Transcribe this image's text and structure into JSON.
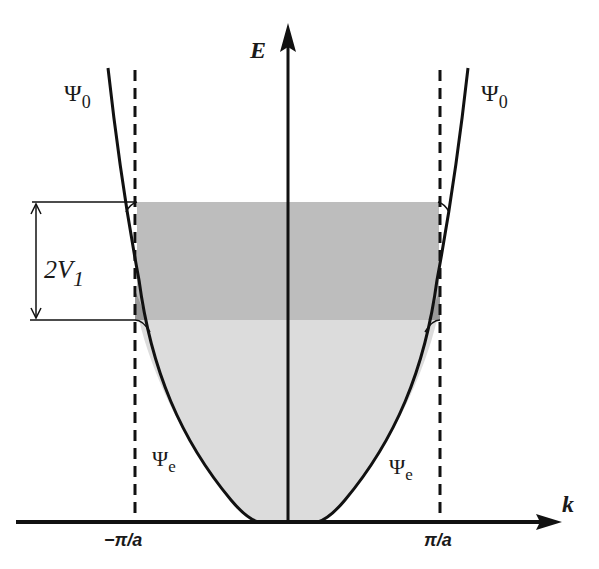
{
  "diagram": {
    "title": "",
    "axes": {
      "y_label": "E",
      "x_label": "k"
    },
    "ticks": {
      "left": "−π/a",
      "right": "π/a"
    },
    "curves": {
      "upper_left": {
        "symbol": "Ψ",
        "subscript": "0"
      },
      "upper_right": {
        "symbol": "Ψ",
        "subscript": "0"
      },
      "lower_left": {
        "symbol": "Ψ",
        "subscript": "e"
      },
      "lower_right": {
        "symbol": "Ψ",
        "subscript": "e"
      }
    },
    "gap_annotation": {
      "main": "2V",
      "subscript": "1"
    },
    "regions": [
      {
        "name": "band-gap",
        "color": "#bdbdbd"
      },
      {
        "name": "filled-band",
        "color": "#dcdcdc"
      }
    ],
    "colors": {
      "line": "#111111",
      "gap_fill": "#bdbdbd",
      "band_fill": "#dcdcdc",
      "background": "#ffffff"
    }
  }
}
